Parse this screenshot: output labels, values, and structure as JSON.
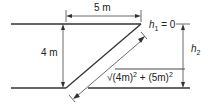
{
  "diagram": {
    "labels": {
      "width": "5 m",
      "height": "4 m",
      "h1": "h",
      "h1_sub": "1",
      "h1_eq": " = 0",
      "h2": "h",
      "h2_sub": "2",
      "hyp_sqrt": "√",
      "hyp_a": "(4m)",
      "hyp_a_exp": "2",
      "hyp_plus": " + ",
      "hyp_b": "(5m)",
      "hyp_b_exp": "2"
    },
    "colors": {
      "line": "#333333",
      "text": "#222222",
      "background": "#ffffff"
    }
  }
}
